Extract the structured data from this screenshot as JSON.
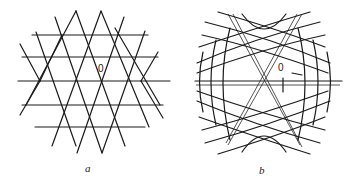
{
  "figure": {
    "panels": [
      {
        "id": "a",
        "caption": "a",
        "origin_label": "0",
        "center": [
          89,
          81
        ],
        "description": "Straight-line triangular lattice clipped to a six-pointed star / hexagonal region"
      },
      {
        "id": "b",
        "caption": "b",
        "origin_label": "0",
        "center": [
          264,
          82
        ],
        "description": "Curved-line lattice: three families of arcs forming a hexagonal region, with straight lines through origin"
      }
    ]
  },
  "colors": {
    "line": "#1a1a1a",
    "background": "#ffffff"
  }
}
